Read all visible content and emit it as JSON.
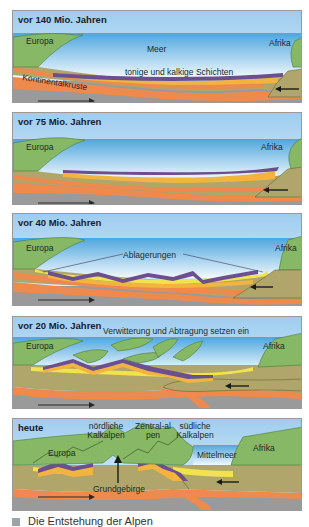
{
  "panels": [
    {
      "title": "vor 140 Mio. Jahren",
      "labels": {
        "europe": "Europa",
        "africa": "Afrika",
        "sea": "Meer",
        "layers": "tonige und kalkige Schichten",
        "crust": "Kontinentalkruste"
      }
    },
    {
      "title": "vor 75 Mio. Jahren",
      "labels": {
        "europe": "Europa",
        "africa": "Afrika"
      }
    },
    {
      "title": "vor 40 Mio. Jahren",
      "labels": {
        "europe": "Europa",
        "africa": "Afrika",
        "deposits": "Ablagerungen"
      }
    },
    {
      "title": "vor 20 Mio. Jahren",
      "labels": {
        "europe": "Europa",
        "africa": "Afrika",
        "erosion": "Verwitterung und Abtragung setzen ein"
      }
    },
    {
      "title": "heute",
      "labels": {
        "europe": "Europa",
        "africa": "Afrika",
        "north_alps": "nördliche Kalkalpen",
        "central_alps": "Zentral-alpen",
        "south_alps": "südliche Kalkalpen",
        "med": "Mittelmeer",
        "basement": "Grundgebirge"
      }
    }
  ],
  "caption": "Die Entstehung der Alpen",
  "colors": {
    "sky": "#a9d3ef",
    "sea": "#cfe7f5",
    "land": "#86b865",
    "crust": "#b0a56a",
    "orange": "#ee8a4e",
    "yellow": "#f3b43f",
    "purple": "#6b4f8f",
    "mantle": "#9a9a9a"
  }
}
